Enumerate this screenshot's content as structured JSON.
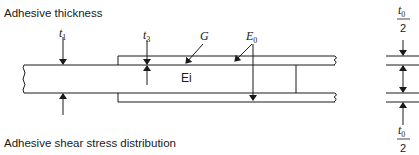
{
  "captions": {
    "top": "Adhesive thickness",
    "bottom": "Adhesive shear stress distribution"
  },
  "labels": {
    "t1": {
      "main": "t",
      "sub": "1"
    },
    "t3": {
      "main": "t",
      "sub": "3"
    },
    "G": "G",
    "E0": {
      "main": "E",
      "sub": "0"
    },
    "Ei": "Ei",
    "t0_top": {
      "num_main": "t",
      "num_sub": "0",
      "den": "2"
    },
    "t0_bottom": {
      "num_main": "t",
      "num_sub": "0",
      "den": "2"
    }
  },
  "colors": {
    "line": "#1a1a1a",
    "background": "#ffffff"
  }
}
